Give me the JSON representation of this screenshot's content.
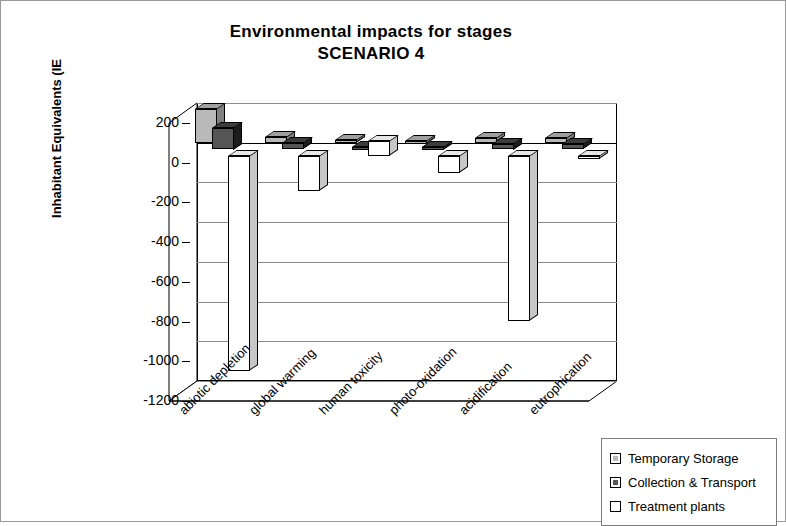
{
  "chart_data": {
    "type": "bar",
    "title": "Environmental impacts for stages",
    "subtitle": "SCENARIO 4",
    "xlabel": "",
    "ylabel": "Inhabitant Equivalents (IE",
    "ylim": [
      -1200,
      200
    ],
    "ytick_step": 200,
    "ytick_labels": [
      "200",
      "0",
      "-200",
      "-400",
      "-600",
      "-800",
      "-1000",
      "-1200"
    ],
    "ytick_values": [
      200,
      0,
      -200,
      -400,
      -600,
      -800,
      -1000,
      -1200
    ],
    "grid": true,
    "three_d": true,
    "legend_position": "bottom-right",
    "categories": [
      "abiotic depletion",
      "global warming",
      "human toxicity",
      "photo-oxidation",
      "acidification",
      "eutrophication"
    ],
    "series": [
      {
        "name": "Temporary Storage",
        "color": "#b9b9b9",
        "values": [
          170,
          30,
          12,
          8,
          22,
          25
        ]
      },
      {
        "name": "Collection & Transport",
        "color": "#555555",
        "values": [
          110,
          32,
          14,
          10,
          28,
          27
        ]
      },
      {
        "name": "Treatment plants",
        "color": "#ffffff",
        "values": [
          -1085,
          -175,
          75,
          -85,
          -830,
          -8
        ]
      }
    ]
  },
  "legend": {
    "items": [
      {
        "label": "Temporary Storage",
        "color": "#b9b9b9"
      },
      {
        "label": "Collection & Transport",
        "color": "#555555"
      },
      {
        "label": "Treatment plants",
        "color": "#ffffff"
      }
    ]
  }
}
